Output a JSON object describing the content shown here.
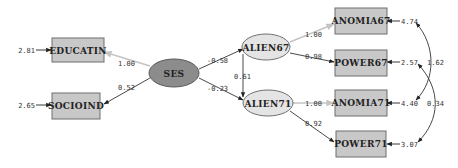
{
  "diagram": {
    "type": "structural-equation-path-diagram",
    "observed": [
      {
        "id": "EDUCATIN",
        "label": "EDUCATIN",
        "error": "2.81"
      },
      {
        "id": "SOCIOIND",
        "label": "SOCIOIND",
        "error": "2.65"
      },
      {
        "id": "ANOMIA67",
        "label": "ANOMIA67",
        "error": "4.74"
      },
      {
        "id": "POWER67",
        "label": "POWER67",
        "error": "2.57"
      },
      {
        "id": "ANOMIA71",
        "label": "ANOMIA71",
        "error": "4.40"
      },
      {
        "id": "POWER71",
        "label": "POWER71",
        "error": "3.07"
      }
    ],
    "latent": [
      {
        "id": "SES",
        "label": "SES"
      },
      {
        "id": "ALIEN67",
        "label": "ALIEN67"
      },
      {
        "id": "ALIEN71",
        "label": "ALIEN71"
      }
    ],
    "paths": [
      {
        "from": "SES",
        "to": "EDUCATIN",
        "coef": "1.00",
        "fixed": true
      },
      {
        "from": "SES",
        "to": "SOCIOIND",
        "coef": "0.52",
        "fixed": false
      },
      {
        "from": "SES",
        "to": "ALIEN67",
        "coef": "-0.58",
        "fixed": false
      },
      {
        "from": "SES",
        "to": "ALIEN71",
        "coef": "-0.23",
        "fixed": false
      },
      {
        "from": "ALIEN67",
        "to": "ALIEN71",
        "coef": "0.61",
        "fixed": false
      },
      {
        "from": "ALIEN67",
        "to": "ANOMIA67",
        "coef": "1.00",
        "fixed": true
      },
      {
        "from": "ALIEN67",
        "to": "POWER67",
        "coef": "0.98",
        "fixed": false
      },
      {
        "from": "ALIEN71",
        "to": "ANOMIA71",
        "coef": "1.00",
        "fixed": true
      },
      {
        "from": "ALIEN71",
        "to": "POWER71",
        "coef": "0.92",
        "fixed": false
      }
    ],
    "covariances": [
      {
        "between": [
          "ANOMIA67",
          "ANOMIA71"
        ],
        "value": "1.62"
      },
      {
        "between": [
          "POWER67",
          "POWER71"
        ],
        "value": "0.34"
      }
    ]
  },
  "colors": {
    "observed_fill": "#c8c8c8",
    "latent_fill": "#e4e4e4",
    "exogenous_fill": "#8c8c8c",
    "fixed_path": "#c4c4c4"
  }
}
